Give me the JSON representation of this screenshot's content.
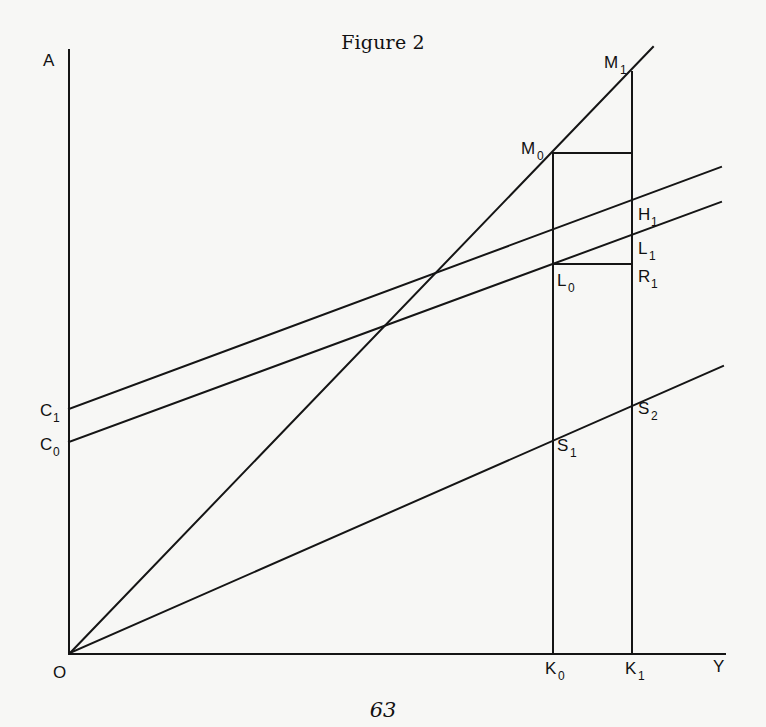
{
  "figure": {
    "title": "Figure 2",
    "page_number": "63"
  },
  "axes": {
    "vertical_label": "A",
    "horizontal_label": "Y",
    "origin_label": "O"
  },
  "points": {
    "M0": {
      "base": "M",
      "sub": "0"
    },
    "M1": {
      "base": "M",
      "sub": "1"
    },
    "H1": {
      "base": "H",
      "sub": "1"
    },
    "L1": {
      "base": "L",
      "sub": "1"
    },
    "R1": {
      "base": "R",
      "sub": "1"
    },
    "L0": {
      "base": "L",
      "sub": "0"
    },
    "C1": {
      "base": "C",
      "sub": "1"
    },
    "C0": {
      "base": "C",
      "sub": "0"
    },
    "S1": {
      "base": "S",
      "sub": "1"
    },
    "S2": {
      "base": "S",
      "sub": "2"
    },
    "K0": {
      "base": "K",
      "sub": "0"
    },
    "K1": {
      "base": "K",
      "sub": "1"
    }
  },
  "lines": [
    {
      "name": "45-degree ray",
      "from": "O",
      "through": [
        "M0",
        "M1"
      ]
    },
    {
      "name": "upper parallel line",
      "from": "C1",
      "through": [
        "H1"
      ]
    },
    {
      "name": "lower parallel line",
      "from": "C0",
      "through": [
        "L0",
        "L1"
      ]
    },
    {
      "name": "savings ray",
      "from": "O",
      "through": [
        "S1",
        "S2"
      ]
    },
    {
      "name": "vertical at K0",
      "from": "K0",
      "to": "M0"
    },
    {
      "name": "vertical at K1",
      "from": "K1",
      "to": "M1"
    },
    {
      "name": "horizontal M0",
      "from": "M0",
      "to": "K1 vertical"
    },
    {
      "name": "horizontal L0-R1",
      "from": "L0",
      "to": "R1"
    }
  ],
  "colors": {
    "background": "#f7f7f5",
    "ink": "#151515"
  }
}
